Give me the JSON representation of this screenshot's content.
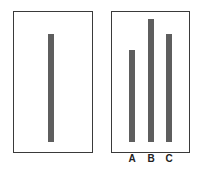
{
  "diagram": {
    "type": "asch-line-judgment",
    "reference_card": {
      "lines": [
        {
          "id": "reference",
          "relative_length": 108
        }
      ]
    },
    "comparison_card": {
      "lines": [
        {
          "label": "A",
          "relative_length": 92
        },
        {
          "label": "B",
          "relative_length": 123
        },
        {
          "label": "C",
          "relative_length": 108
        }
      ]
    },
    "colors": {
      "border": "#3a3a3a",
      "line": "#5e5e5e",
      "background": "#ffffff"
    }
  },
  "labels": {
    "a": "A",
    "b": "B",
    "c": "C"
  }
}
